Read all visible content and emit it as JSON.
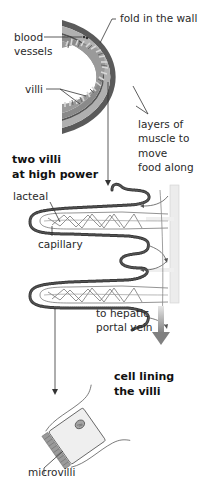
{
  "diagram": {
    "cross_section": {
      "labels": {
        "fold": "fold in the wall",
        "blood_vessels_1": "blood",
        "blood_vessels_2": "vessels",
        "villi": "villi",
        "muscle_1": "layers of",
        "muscle_2": "muscle to",
        "muscle_3": "move",
        "muscle_4": "food along"
      }
    },
    "villi_detail": {
      "heading_1": "two villi",
      "heading_2": "at high power",
      "labels": {
        "lacteal": "lacteal",
        "capillary": "capillary",
        "hepatic_1": "to hepatic",
        "hepatic_2": "portal vein"
      }
    },
    "cell_detail": {
      "heading_1": "cell lining",
      "heading_2": "the villi",
      "labels": {
        "microvilli": "microvilli"
      }
    },
    "colors": {
      "outer_wall": "#5a5a5a",
      "muscle_layer": "#a8a8a8",
      "inner_wall": "#6e6e6e",
      "villi_fill": "#b5b5b5",
      "arrow": "#8a8a8a",
      "leader_line": "#333333"
    }
  }
}
